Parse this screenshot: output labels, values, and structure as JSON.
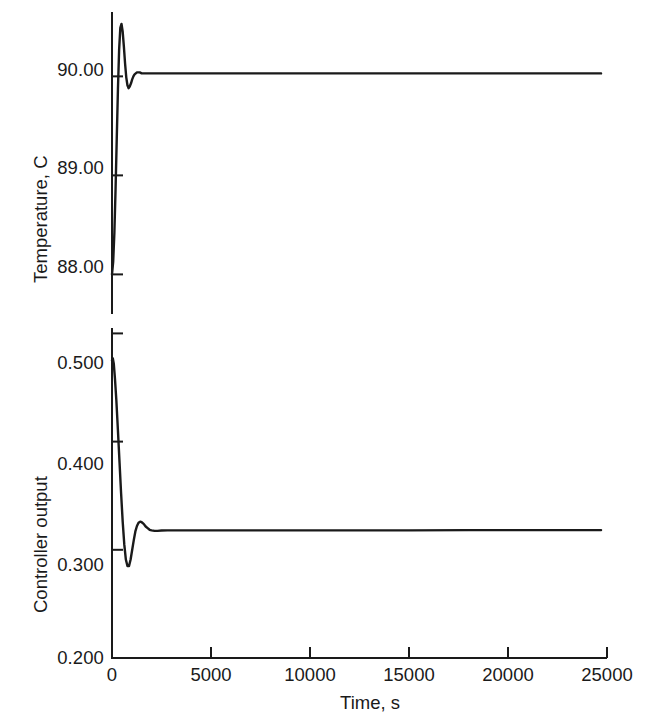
{
  "chart_data": {
    "type": "line",
    "title": "",
    "subtitle": "",
    "xlabel": "Time, s",
    "xlim": [
      0,
      25000
    ],
    "xticks": [
      0,
      5000,
      10000,
      15000,
      20000,
      25000
    ],
    "xtick_labels": [
      "0",
      "5000",
      "10000",
      "15000",
      "20000",
      "25000"
    ],
    "grid": false,
    "legend": "none",
    "panels": [
      {
        "id": "temperature",
        "ylabel": "Temperature, C",
        "ylim": [
          87.6,
          90.65
        ],
        "yticks": [
          88.0,
          89.0,
          90.0
        ],
        "ytick_labels": [
          "88.00",
          "89.00",
          "90.00"
        ],
        "series": [
          {
            "name": "Temperature",
            "color": "#1a1a1a",
            "x": [
              0,
              60,
              120,
              180,
              240,
              300,
              360,
              420,
              480,
              540,
              600,
              660,
              720,
              780,
              840,
              900,
              960,
              1020,
              1080,
              1140,
              1200,
              1260,
              1320,
              1400,
              1500,
              1600,
              1700,
              1800,
              1900,
              2000,
              2200,
              2500,
              3000,
              4000,
              6000,
              9000,
              12000,
              15000,
              18000,
              21000,
              24000,
              24700
            ],
            "y": [
              88.0,
              88.13,
              88.42,
              88.86,
              89.37,
              89.87,
              90.27,
              90.49,
              90.53,
              90.45,
              90.3,
              90.13,
              89.99,
              89.91,
              89.88,
              89.9,
              89.93,
              89.97,
              90.0,
              90.02,
              90.03,
              90.04,
              90.04,
              90.04,
              90.03,
              90.03,
              90.03,
              90.03,
              90.03,
              90.03,
              90.03,
              90.03,
              90.03,
              90.03,
              90.03,
              90.03,
              90.03,
              90.03,
              90.03,
              90.03,
              90.03,
              90.03
            ]
          }
        ]
      },
      {
        "id": "controller-output",
        "ylabel": "Controller output",
        "ylim": [
          0.2,
          0.505
        ],
        "yticks": [
          0.2,
          0.3,
          0.4,
          0.5
        ],
        "ytick_labels": [
          "0.200",
          "0.300",
          "0.400",
          "0.500"
        ],
        "series": [
          {
            "name": "Controller output",
            "color": "#1a1a1a",
            "x": [
              0,
              40,
              90,
              150,
              220,
              300,
              380,
              460,
              540,
              620,
              700,
              780,
              860,
              940,
              1020,
              1100,
              1180,
              1260,
              1340,
              1420,
              1500,
              1600,
              1700,
              1800,
              1900,
              2000,
              2150,
              2300,
              2500,
              2800,
              3200,
              4000,
              6000,
              9000,
              12000,
              15000,
              18000,
              21000,
              24000,
              24700
            ],
            "y": [
              0.475,
              0.477,
              0.472,
              0.458,
              0.438,
              0.41,
              0.381,
              0.352,
              0.326,
              0.305,
              0.291,
              0.285,
              0.285,
              0.291,
              0.3,
              0.309,
              0.317,
              0.322,
              0.325,
              0.326,
              0.3255,
              0.324,
              0.3215,
              0.32,
              0.3185,
              0.318,
              0.3175,
              0.3175,
              0.3178,
              0.318,
              0.318,
              0.318,
              0.318,
              0.318,
              0.318,
              0.318,
              0.3182,
              0.3182,
              0.3182,
              0.3182
            ]
          }
        ]
      }
    ]
  },
  "style": {
    "axis_color": "#1a1a1a",
    "curve_color": "#1a1a1a",
    "background": "#ffffff"
  }
}
